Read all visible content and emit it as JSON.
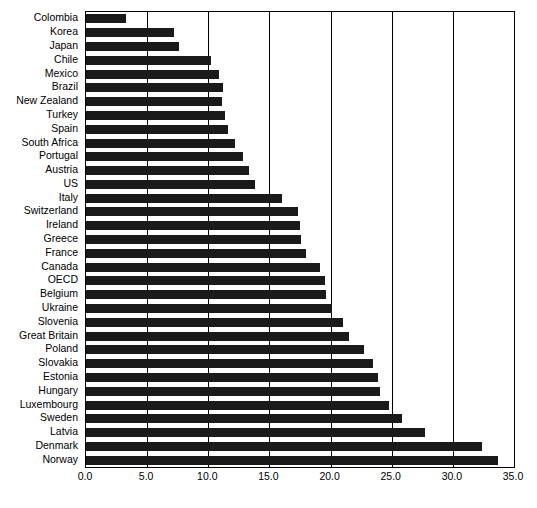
{
  "chart_data": {
    "type": "bar",
    "orientation": "horizontal",
    "title": "",
    "subtitle": "",
    "xlabel": "",
    "ylabel": "",
    "xlim": [
      0.0,
      35.0
    ],
    "xticks": [
      "0.0",
      "5.0",
      "10.0",
      "15.0",
      "20.0",
      "25.0",
      "30.0",
      "35.0"
    ],
    "xtick_values": [
      0.0,
      5.0,
      10.0,
      15.0,
      20.0,
      25.0,
      30.0,
      35.0
    ],
    "grid": true,
    "grid_axis": "x",
    "legend": null,
    "bar_color": "#1a1a1a",
    "background_color": "#ffffff",
    "axis_color": "#000000",
    "categories": [
      "Colombia",
      "Korea",
      "Japan",
      "Chile",
      "Mexico",
      "Brazil",
      "New Zealand",
      "Turkey",
      "Spain",
      "South Africa",
      "Portugal",
      "Austria",
      "US",
      "Italy",
      "Switzerland",
      "Ireland",
      "Greece",
      "France",
      "Canada",
      "OECD",
      "Belgium",
      "Ukraine",
      "Slovenia",
      "Great Britain",
      "Poland",
      "Slovakia",
      "Estonia",
      "Hungary",
      "Luxembourg",
      "Sweden",
      "Latvia",
      "Denmark",
      "Norway"
    ],
    "values": [
      3.3,
      7.2,
      7.6,
      10.2,
      10.9,
      11.2,
      11.1,
      11.4,
      11.6,
      12.2,
      12.8,
      13.3,
      13.8,
      16.0,
      17.3,
      17.5,
      17.6,
      18.0,
      19.1,
      19.5,
      19.6,
      20.1,
      21.0,
      21.5,
      22.7,
      23.5,
      23.9,
      24.0,
      24.8,
      25.8,
      27.7,
      32.4,
      33.7
    ]
  }
}
